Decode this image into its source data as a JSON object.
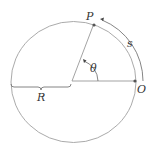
{
  "diagram": {
    "title": "",
    "labels": {
      "point_p": "P",
      "point_o": "O",
      "arc_length": "s",
      "angle": "θ",
      "radius": "R"
    },
    "colors": {
      "circle": "#999999",
      "lines": "#888888",
      "points": "#555555",
      "text": "#333333"
    }
  }
}
